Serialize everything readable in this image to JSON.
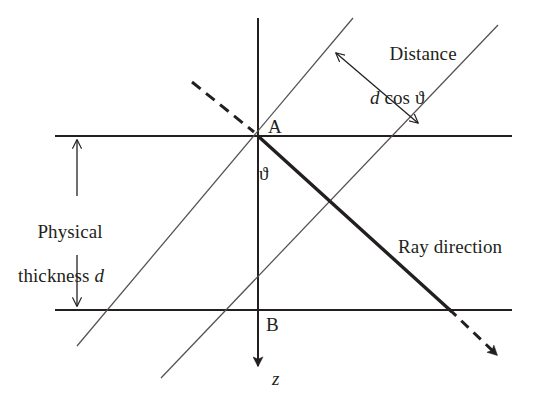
{
  "figure": {
    "background_color": "#ffffff",
    "ink_color": "#231f20",
    "width": 539,
    "height": 400,
    "labels": {
      "distance_line1": "Distance",
      "distance_d": "d",
      "distance_rest": " cos ϑ",
      "thickness_line1": "Physical",
      "thickness_line2": "thickness ",
      "thickness_d": "d",
      "ray_direction": "Ray direction",
      "point_a": "A",
      "point_b": "B",
      "angle_theta": "ϑ",
      "axis_z": "z"
    },
    "geometry": {
      "point_a": [
        258,
        136
      ],
      "point_b": [
        258,
        310
      ],
      "top_interface_y": 136,
      "bottom_interface_y": 310,
      "interface_x_start": 55,
      "interface_x_end": 512,
      "z_axis_x": 258,
      "z_axis_top": 18,
      "z_axis_arrow_tip": 374,
      "thickness_arrow_x": 77,
      "distance_arrow_start": [
        335,
        52
      ],
      "distance_arrow_end": [
        419,
        124
      ],
      "ray_dashed_in_start": [
        192,
        82
      ],
      "ray_solid_end": [
        451,
        311
      ],
      "ray_dashed_out_end": [
        501,
        359
      ],
      "wavefront1": [
        [
          353,
          18
        ],
        [
          77,
          346
        ]
      ],
      "wavefront2": [
        [
          498,
          25
        ],
        [
          161,
          378
        ]
      ]
    }
  }
}
